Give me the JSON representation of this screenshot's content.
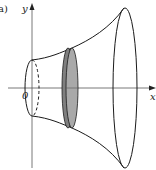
{
  "figure": {
    "label": "a)",
    "y_axis_label": "y",
    "x_axis_label": "x",
    "origin_label": "0",
    "colors": {
      "stroke": "#1a1a1a",
      "axis": "#333333",
      "disk_fill": "#a9a9a9",
      "disk_edge_fill": "#7f7f7f"
    }
  }
}
